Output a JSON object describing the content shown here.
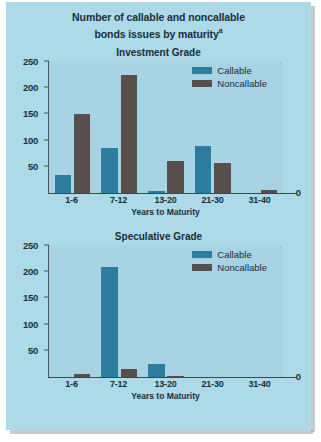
{
  "figure": {
    "title_line1": "Number of callable and noncallable",
    "title_line2": "bonds issues by maturity",
    "title_superscript": "a"
  },
  "legend": {
    "callable_label": "Callable",
    "noncallable_label": "Noncallable"
  },
  "colors": {
    "callable": "#2d7e9e",
    "noncallable": "#564f4b",
    "figure_background": "#addae8",
    "plot_background": "#a7d3e4",
    "axis": "#4a5257",
    "text": "#1b2d36"
  },
  "axis": {
    "xlabel": "Years to Maturity",
    "zero_label": "0",
    "yticks": [
      "250",
      "200",
      "150",
      "100",
      "50"
    ],
    "categories": [
      "1-6",
      "7-12",
      "13-20",
      "21-30",
      "31-40"
    ]
  },
  "panels": [
    {
      "title": "Investment Grade"
    },
    {
      "title": "Speculative Grade"
    }
  ],
  "chart_data": [
    {
      "type": "bar",
      "title": "Investment Grade",
      "subtitle": "Number of callable and noncallable bonds issues by maturity",
      "xlabel": "Years to Maturity",
      "ylabel": "",
      "categories": [
        "1-6",
        "7-12",
        "13-20",
        "21-30",
        "31-40"
      ],
      "series": [
        {
          "name": "Callable",
          "color": "#2d7e9e",
          "values": [
            33,
            85,
            3,
            88,
            0
          ]
        },
        {
          "name": "Noncallable",
          "color": "#564f4b",
          "values": [
            149,
            222,
            60,
            55,
            4
          ]
        }
      ],
      "ylim": [
        0,
        250
      ],
      "yticks": [
        0,
        50,
        100,
        150,
        200,
        250
      ],
      "grid": false,
      "legend_position": "top-right"
    },
    {
      "type": "bar",
      "title": "Speculative Grade",
      "subtitle": "Number of callable and noncallable bonds issues by maturity",
      "xlabel": "Years to Maturity",
      "ylabel": "",
      "categories": [
        "1-6",
        "7-12",
        "13-20",
        "21-30",
        "31-40"
      ],
      "series": [
        {
          "name": "Callable",
          "color": "#2d7e9e",
          "values": [
            0,
            207,
            23,
            0,
            0
          ]
        },
        {
          "name": "Noncallable",
          "color": "#564f4b",
          "values": [
            5,
            15,
            1,
            0,
            0
          ]
        }
      ],
      "ylim": [
        0,
        250
      ],
      "yticks": [
        0,
        50,
        100,
        150,
        200,
        250
      ],
      "grid": false,
      "legend_position": "top-right"
    }
  ]
}
